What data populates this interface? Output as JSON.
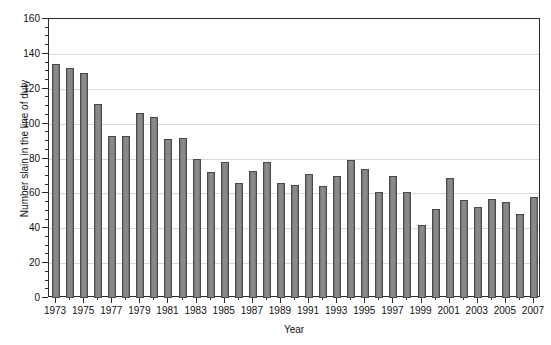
{
  "chart_data": {
    "type": "bar",
    "title": "",
    "xlabel": "Year",
    "ylabel": "Number slain in the line of duty",
    "ylim": [
      0,
      160
    ],
    "ytick_step": 20,
    "yticks": [
      0,
      20,
      40,
      60,
      80,
      100,
      120,
      140,
      160
    ],
    "ytick_labels": [
      "0",
      "20",
      "40",
      "60",
      "80",
      "100",
      "120",
      "140",
      "160"
    ],
    "grid": true,
    "legend": "none",
    "xtick_labels": [
      "1973",
      "1975",
      "1977",
      "1979",
      "1981",
      "1983",
      "1985",
      "1987",
      "1989",
      "1991",
      "1993",
      "1995",
      "1997",
      "1999",
      "2001",
      "2003",
      "2005",
      "2007"
    ],
    "categories": [
      "1973",
      "1974",
      "1975",
      "1976",
      "1977",
      "1978",
      "1979",
      "1980",
      "1981",
      "1982",
      "1983",
      "1984",
      "1985",
      "1986",
      "1987",
      "1988",
      "1989",
      "1990",
      "1991",
      "1992",
      "1993",
      "1994",
      "1995",
      "1996",
      "1997",
      "1998",
      "1999",
      "2000",
      "2001",
      "2002",
      "2003",
      "2004",
      "2005",
      "2006",
      "2007"
    ],
    "values": [
      134,
      132,
      129,
      111,
      93,
      93,
      106,
      104,
      91,
      92,
      80,
      72,
      78,
      66,
      73,
      78,
      66,
      65,
      71,
      64,
      70,
      79,
      74,
      61,
      70,
      61,
      42,
      51,
      69,
      56,
      52,
      57,
      55,
      48,
      58
    ]
  },
  "colors": {
    "bar_fill": "#7f7f7f",
    "bar_edge": "#4a4a4a",
    "axis": "#2b2b2b",
    "grid": "#d9d9d9",
    "text": "#111111",
    "background": "#ffffff"
  }
}
